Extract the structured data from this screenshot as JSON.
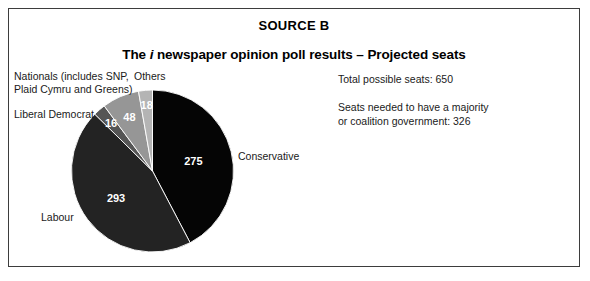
{
  "figure": {
    "source_heading": "SOURCE B",
    "title_prefix": "The ",
    "title_italic": "i",
    "title_rest": " newspaper opinion poll results – Projected seats"
  },
  "info": {
    "total_seats_line": "Total possible seats: 650",
    "majority_line_1": "Seats needed to have a majority",
    "majority_line_2": "or coalition government: 326"
  },
  "callouts": {
    "nationals_line_1": "Nationals (includes SNP,",
    "nationals_line_2": "Plaid Cymru and Greens)",
    "liberal_democrat": "Liberal Democrat",
    "others": "Others",
    "conservative": "Conservative",
    "labour": "Labour"
  },
  "slice_labels": {
    "conservative": "275",
    "labour": "293",
    "liberal_democrat": "16",
    "nationals": "48",
    "others": "18"
  },
  "chart_data": {
    "type": "pie",
    "title": "The i newspaper opinion poll results – Projected seats",
    "subtitle": "SOURCE B",
    "total": 650,
    "majority_threshold": 326,
    "start_angle_deg": 0,
    "direction": "clockwise",
    "legend": "inline-callouts",
    "grid": false,
    "categories": [
      "Conservative",
      "Labour",
      "Liberal Democrat",
      "Nationals (includes SNP, Plaid Cymru and Greens)",
      "Others"
    ],
    "values": [
      275,
      293,
      16,
      48,
      18
    ],
    "labels": [
      "275",
      "293",
      "16",
      "48",
      "18"
    ],
    "colors": [
      "#050505",
      "#232323",
      "#555555",
      "#969696",
      "#b4b4b4"
    ],
    "slices": [
      {
        "name": "Conservative",
        "value": 275,
        "label": "275",
        "color": "#050505"
      },
      {
        "name": "Labour",
        "value": 293,
        "label": "293",
        "color": "#232323"
      },
      {
        "name": "Liberal Democrat",
        "value": 16,
        "label": "16",
        "color": "#555555"
      },
      {
        "name": "Nationals (includes SNP, Plaid Cymru and Greens)",
        "value": 48,
        "label": "48",
        "color": "#969696"
      },
      {
        "name": "Others",
        "value": 18,
        "label": "18",
        "color": "#b4b4b4"
      }
    ],
    "xlabel": "",
    "ylabel": ""
  },
  "colors": {
    "border": "#3d3d3d",
    "background": "#ffffff",
    "text": "#1a1a1a"
  }
}
